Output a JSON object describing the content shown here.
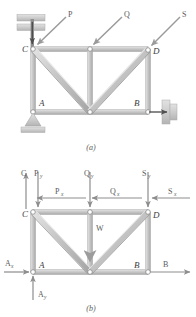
{
  "figure": {
    "panels": [
      {
        "id": "a",
        "caption": "(a)",
        "description": "Truss structure with supports and applied loads P, Q, S",
        "nodes": [
          {
            "name": "C",
            "label": "C",
            "x": 33,
            "y": 49
          },
          {
            "name": "E",
            "label": "",
            "x": 90,
            "y": 49
          },
          {
            "name": "D",
            "label": "D",
            "x": 148,
            "y": 50
          },
          {
            "name": "A",
            "label": "A",
            "x": 33,
            "y": 112
          },
          {
            "name": "F",
            "label": "",
            "x": 90,
            "y": 112
          },
          {
            "name": "B",
            "label": "B",
            "x": 148,
            "y": 112
          }
        ],
        "loads": [
          {
            "name": "P",
            "label": "P"
          },
          {
            "name": "Q",
            "label": "Q"
          },
          {
            "name": "S",
            "label": "S"
          }
        ],
        "supports": [
          {
            "name": "top-bracket-support",
            "at": "C"
          },
          {
            "name": "pin-support",
            "at": "A"
          },
          {
            "name": "roller-wall-support",
            "at": "B"
          }
        ]
      },
      {
        "id": "b",
        "caption": "(b)",
        "description": "Free-body diagram showing reaction and load components",
        "nodes": [
          {
            "name": "C",
            "label": "C",
            "x": 33,
            "y": 212
          },
          {
            "name": "E",
            "label": "",
            "x": 90,
            "y": 212
          },
          {
            "name": "D",
            "label": "D",
            "x": 148,
            "y": 212
          },
          {
            "name": "A",
            "label": "A",
            "x": 33,
            "y": 272
          },
          {
            "name": "F",
            "label": "",
            "x": 90,
            "y": 272
          },
          {
            "name": "B",
            "label": "B",
            "x": 148,
            "y": 272
          }
        ],
        "forces": [
          {
            "name": "C",
            "base": "C",
            "sub": "",
            "dir": "up"
          },
          {
            "name": "Py",
            "base": "P",
            "sub": "y",
            "dir": "down"
          },
          {
            "name": "Px",
            "base": "P",
            "sub": "x",
            "dir": "left"
          },
          {
            "name": "Qy",
            "base": "Q",
            "sub": "y",
            "dir": "down"
          },
          {
            "name": "Qx",
            "base": "Q",
            "sub": "x",
            "dir": "left"
          },
          {
            "name": "Sy",
            "base": "S",
            "sub": "y",
            "dir": "down"
          },
          {
            "name": "Sx",
            "base": "S",
            "sub": "x",
            "dir": "left"
          },
          {
            "name": "W",
            "base": "W",
            "sub": "",
            "dir": "down"
          },
          {
            "name": "Ax",
            "base": "A",
            "sub": "x",
            "dir": "right"
          },
          {
            "name": "Ay",
            "base": "A",
            "sub": "y",
            "dir": "up"
          },
          {
            "name": "B",
            "base": "B",
            "sub": "",
            "dir": "right"
          }
        ]
      }
    ]
  },
  "colors": {
    "member_light": "#d8d8d8",
    "member_mid": "#bdbdbd",
    "member_dark": "#a0a0a0",
    "arrow": "#8c8c8c",
    "arrow_dark": "#6e6e6e",
    "hatch": "#c9c9c9",
    "text": "#4a4a4a",
    "node_fill": "#ffffff",
    "node_stroke": "#8a8a8a"
  }
}
